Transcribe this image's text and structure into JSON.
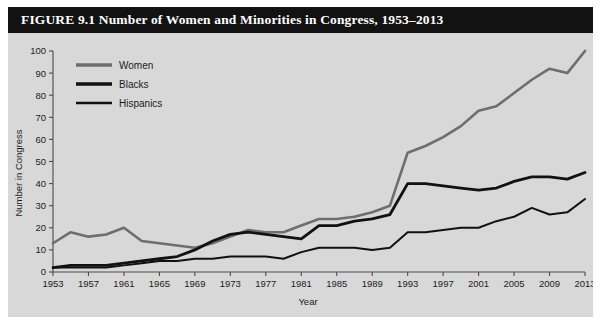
{
  "figure": {
    "title": "FIGURE 9.1 Number of Women and Minorities in Congress, 1953–2013",
    "background_color": "#d8d8d8",
    "title_bar_color": "#121212",
    "title_text_color": "#ffffff"
  },
  "legend": {
    "position": "top-left-inside",
    "entries": [
      {
        "label": "Women",
        "color": "#6e6e6e",
        "width": 3.4
      },
      {
        "label": "Blacks",
        "color": "#111111",
        "width": 3.4
      },
      {
        "label": "Hispanics",
        "color": "#111111",
        "width": 2.6
      }
    ]
  },
  "chart_data": {
    "type": "line",
    "title": "FIGURE 9.1 Number of Women and Minorities in Congress, 1953–2013",
    "xlabel": "Year",
    "ylabel": "Number in Congress",
    "xlim": [
      1953,
      2013
    ],
    "ylim": [
      0,
      100
    ],
    "ytick_step": 10,
    "grid": false,
    "legend_position": "upper left",
    "xticks": [
      1953,
      1957,
      1961,
      1965,
      1969,
      1973,
      1977,
      1981,
      1985,
      1989,
      1993,
      1997,
      2001,
      2005,
      2009,
      2013
    ],
    "yticks": [
      0,
      10,
      20,
      30,
      40,
      50,
      60,
      70,
      80,
      90,
      100
    ],
    "x": [
      1953,
      1955,
      1957,
      1959,
      1961,
      1963,
      1965,
      1967,
      1969,
      1971,
      1973,
      1975,
      1977,
      1979,
      1981,
      1983,
      1985,
      1987,
      1989,
      1991,
      1993,
      1995,
      1997,
      1999,
      2001,
      2003,
      2005,
      2007,
      2009,
      2011,
      2013
    ],
    "series": [
      {
        "name": "Women",
        "color": "#6e6e6e",
        "width": 2.6,
        "values": [
          13,
          18,
          16,
          17,
          20,
          14,
          13,
          12,
          11,
          13,
          16,
          19,
          18,
          18,
          21,
          24,
          24,
          25,
          27,
          30,
          54,
          57,
          61,
          66,
          73,
          75,
          81,
          87,
          92,
          90,
          100
        ]
      },
      {
        "name": "Blacks",
        "color": "#111111",
        "width": 2.8,
        "values": [
          2,
          3,
          3,
          3,
          4,
          5,
          6,
          7,
          10,
          14,
          17,
          18,
          17,
          16,
          15,
          21,
          21,
          23,
          24,
          26,
          40,
          40,
          39,
          38,
          37,
          38,
          41,
          43,
          43,
          42,
          45
        ]
      },
      {
        "name": "Hispanics",
        "color": "#111111",
        "width": 2.0,
        "values": [
          2,
          2,
          2,
          2,
          3,
          4,
          5,
          5,
          6,
          6,
          7,
          7,
          7,
          6,
          9,
          11,
          11,
          11,
          10,
          11,
          18,
          18,
          19,
          20,
          20,
          23,
          25,
          29,
          26,
          27,
          33
        ]
      }
    ]
  }
}
